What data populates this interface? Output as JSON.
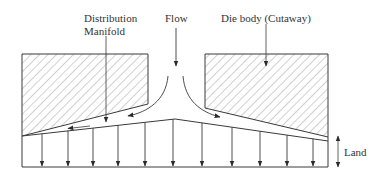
{
  "labels": {
    "distribution": "Distribution",
    "manifold": "Manifold",
    "flow": "Flow",
    "die_body": "Die body (Cutaway)",
    "land": "Land"
  },
  "colors": {
    "line": "#3a3a3a",
    "hatch": "#7a7a7a",
    "text": "#333333",
    "background": "#ffffff"
  },
  "outlet_arrows": {
    "count": 11,
    "x_positions": [
      42,
      68,
      93,
      118,
      145,
      173,
      202,
      232,
      260,
      287,
      313
    ]
  }
}
